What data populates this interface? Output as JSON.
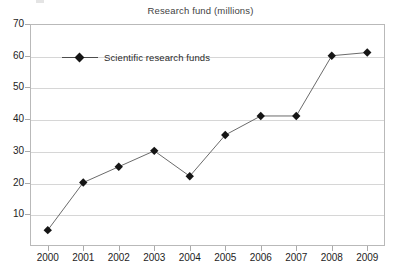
{
  "chart_data": {
    "type": "line",
    "title": "Research fund (millions)",
    "xlabel": "",
    "ylabel": "",
    "categories": [
      "2000",
      "2001",
      "2002",
      "2003",
      "2004",
      "2005",
      "2006",
      "2007",
      "2008",
      "2009"
    ],
    "series": [
      {
        "name": "Scientific research funds",
        "values": [
          5,
          20,
          25,
          30,
          22,
          35,
          41,
          41,
          60,
          61
        ],
        "marker": "diamond",
        "marker_color": "#151515",
        "line_color": "#6b6b6b"
      }
    ],
    "ylim": [
      0,
      70
    ],
    "yticks": [
      10,
      20,
      30,
      40,
      50,
      60,
      70
    ],
    "ytick_labels": [
      "10",
      "20",
      "30",
      "40",
      "50",
      "60",
      "70"
    ],
    "grid": true,
    "grid_color": "#d6d6d6",
    "legend": [
      "Scientific research funds"
    ],
    "legend_position": "inside-top-left"
  },
  "colors": {
    "background": "#ffffff",
    "frame": "#b9b9b9",
    "gridline": "#d6d6d6",
    "title_text": "#3f3f3f",
    "tick_text": "#1d1d1d",
    "marker": "#151515",
    "line": "#6b6b6b"
  }
}
